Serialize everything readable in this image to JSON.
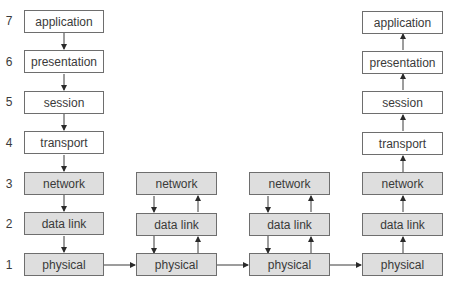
{
  "diagram": {
    "type": "OSI model host-to-host communication via two intermediate nodes",
    "layer_numbers": [
      "7",
      "6",
      "5",
      "4",
      "3",
      "2",
      "1"
    ],
    "colors": {
      "line": "#3a3a3a",
      "box_border": "#6e6e6e",
      "upper_fill": "#ffffff",
      "lower_fill": "#dedede"
    },
    "source_host": {
      "layers": [
        "application",
        "presentation",
        "session",
        "transport",
        "network",
        "data link",
        "physical"
      ]
    },
    "router_1": {
      "layers": [
        "network",
        "data link",
        "physical"
      ]
    },
    "router_2": {
      "layers": [
        "network",
        "data link",
        "physical"
      ]
    },
    "destination_host": {
      "layers": [
        "application",
        "presentation",
        "session",
        "transport",
        "network",
        "data link",
        "physical"
      ]
    }
  }
}
